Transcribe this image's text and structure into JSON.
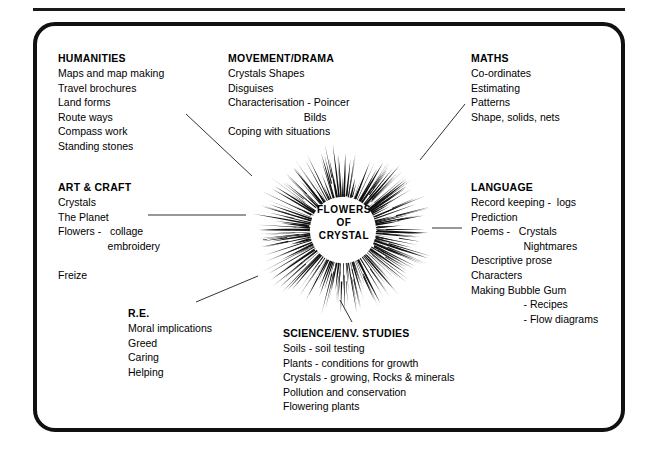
{
  "diagram": {
    "center": {
      "label_lines": [
        "FLOWERS",
        "OF",
        "CRYSTAL"
      ],
      "icon": "starburst-icon"
    },
    "frame": {
      "border_color": "#111111",
      "background": "#ffffff"
    },
    "line_color": "#333333"
  },
  "subjects": [
    {
      "id": "humanities",
      "head": "HUMANITIES",
      "lines": [
        "Maps and map making",
        "Travel brochures",
        "Land forms",
        "Route ways",
        "Compass work",
        "Standing stones"
      ]
    },
    {
      "id": "movement",
      "head": "MOVEMENT/DRAMA",
      "lines": [
        "Crystals Shapes",
        "Disguises",
        "Characterisation - Poincer",
        "                          Bilds",
        "Coping with situations"
      ]
    },
    {
      "id": "maths",
      "head": "MATHS",
      "lines": [
        "Co-ordinates",
        "Estimating",
        "Patterns",
        "Shape, solids, nets"
      ]
    },
    {
      "id": "artcraft",
      "head": "ART & CRAFT",
      "lines": [
        "Crystals",
        "The Planet",
        "Flowers -   collage",
        "                 embroidery",
        "",
        "Freize"
      ]
    },
    {
      "id": "language",
      "head": "LANGUAGE",
      "lines": [
        "Record keeping -  logs",
        "Prediction",
        "Poems -   Crystals",
        "                  Nightmares",
        "Descriptive prose",
        "Characters",
        "Making Bubble Gum",
        "                  - Recipes",
        "                  - Flow diagrams"
      ]
    },
    {
      "id": "re",
      "head": "R.E.",
      "lines": [
        "Moral implications",
        "Greed",
        "Caring",
        "Helping"
      ]
    },
    {
      "id": "science",
      "head": "SCIENCE/ENV. STUDIES",
      "lines": [
        "Soils - soil testing",
        "Plants - conditions for growth",
        "Crystals - growing, Rocks & minerals",
        "Pollution and conservation",
        "Flowering plants"
      ]
    }
  ]
}
